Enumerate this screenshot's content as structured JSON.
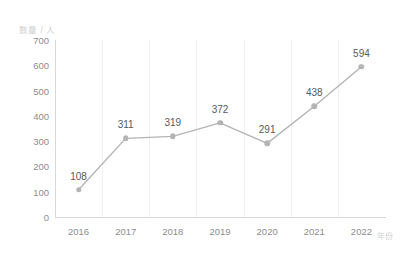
{
  "chart_data": {
    "type": "line",
    "title": "",
    "subtitle": "",
    "xlabel": "年份",
    "ylabel": "数量 / 人",
    "categories": [
      "2016",
      "2017",
      "2018",
      "2019",
      "2020",
      "2021",
      "2022"
    ],
    "values": [
      108,
      311,
      319,
      372,
      291,
      438,
      594
    ],
    "series": [
      {
        "name": "数量",
        "values": [
          108,
          311,
          319,
          372,
          291,
          438,
          594
        ]
      }
    ],
    "data_labels": [
      "108",
      "311",
      "319",
      "372",
      "291",
      "438",
      "594"
    ],
    "ylim": [
      0,
      700
    ],
    "y_ticks": [
      "0",
      "100",
      "200",
      "300",
      "400",
      "500",
      "600",
      "700"
    ],
    "y_tick_values": [
      0,
      100,
      200,
      300,
      400,
      500,
      600,
      700
    ],
    "grid": "vertical",
    "legend": "none",
    "legend_position": "none",
    "colors": {
      "line": "#b4b4b4",
      "marker": "#b4b4b4",
      "gridline": "#f0f0f0",
      "axis": "#d8d8d8",
      "tick_text": "#8d8d8d",
      "label_text": "#595959",
      "caption_text": "#cfcfcf",
      "background": "#ffffff"
    }
  }
}
